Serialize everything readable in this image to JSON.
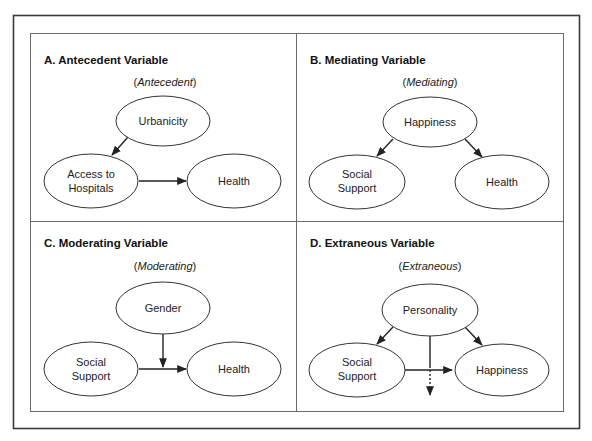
{
  "panels": [
    {
      "id": "A",
      "title": "A.  Antecedent Variable",
      "role_prefix": "(",
      "role_word": "Antecedent",
      "role_suffix": ")",
      "nodes": [
        {
          "id": "urbanicity",
          "lines": [
            "Urbanicity"
          ]
        },
        {
          "id": "access",
          "lines": [
            "Access to",
            "Hospitals"
          ]
        },
        {
          "id": "health",
          "lines": [
            "Health"
          ]
        }
      ],
      "edges": [
        {
          "from": "urbanicity",
          "to": "access",
          "style": "solid"
        },
        {
          "from": "access",
          "to": "health",
          "style": "solid"
        }
      ]
    },
    {
      "id": "B",
      "title": "B. Mediating Variable",
      "role_prefix": "(",
      "role_word": "Mediating",
      "role_suffix": ")",
      "nodes": [
        {
          "id": "happiness",
          "lines": [
            "Happiness"
          ]
        },
        {
          "id": "social_support",
          "lines": [
            "Social",
            "Support"
          ]
        },
        {
          "id": "health",
          "lines": [
            "Health"
          ]
        }
      ],
      "edges": [
        {
          "from": "happiness",
          "to": "social_support",
          "style": "solid"
        },
        {
          "from": "happiness",
          "to": "health",
          "style": "solid"
        }
      ]
    },
    {
      "id": "C",
      "title": "C. Moderating Variable",
      "role_prefix": "(",
      "role_word": "Moderating",
      "role_suffix": ")",
      "nodes": [
        {
          "id": "gender",
          "lines": [
            "Gender"
          ]
        },
        {
          "id": "social_support",
          "lines": [
            "Social",
            "Support"
          ]
        },
        {
          "id": "health",
          "lines": [
            "Health"
          ]
        }
      ],
      "edges": [
        {
          "from": "social_support",
          "to": "health",
          "style": "solid"
        },
        {
          "from": "gender",
          "to": "social_support->health",
          "style": "solid"
        }
      ]
    },
    {
      "id": "D",
      "title": "D. Extraneous Variable",
      "role_prefix": "(",
      "role_word": "Extraneous",
      "role_suffix": ")",
      "nodes": [
        {
          "id": "personality",
          "lines": [
            "Personality"
          ]
        },
        {
          "id": "social_support",
          "lines": [
            "Social",
            "Support"
          ]
        },
        {
          "id": "happiness",
          "lines": [
            "Happiness"
          ]
        }
      ],
      "edges": [
        {
          "from": "personality",
          "to": "social_support",
          "style": "solid"
        },
        {
          "from": "personality",
          "to": "happiness",
          "style": "solid"
        },
        {
          "from": "social_support",
          "to": "happiness",
          "style": "solid"
        },
        {
          "from": "personality",
          "to": "out",
          "style": "dotted"
        }
      ]
    }
  ]
}
